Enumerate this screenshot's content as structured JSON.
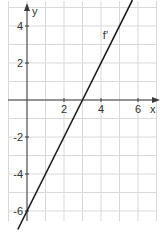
{
  "chart_data": {
    "type": "line",
    "title": "",
    "xlabel": "x",
    "ylabel": "y",
    "xlim": [
      -0.5,
      7.5
    ],
    "ylim": [
      -6.5,
      5.4
    ],
    "grid": true,
    "grid_step": 1,
    "x_ticks": [
      2,
      4,
      6
    ],
    "y_ticks": [
      4,
      2,
      -2,
      -4,
      -6
    ],
    "x_tick_labels": [
      "2",
      "4",
      "6"
    ],
    "y_tick_labels": [
      "4",
      "2",
      "-2",
      "-4",
      "-6"
    ],
    "series": [
      {
        "name": "f'",
        "equation": "f'(x) = 2x - 6",
        "x": [
          -0.5,
          0,
          3,
          5.7
        ],
        "y": [
          -7,
          -6,
          0,
          5.4
        ],
        "color": "#1a1a1a"
      }
    ],
    "annotations": [
      {
        "text": "f'",
        "x": 4.1,
        "y": 3.3
      }
    ],
    "colors": {
      "grid": "#d9d9d9",
      "axis": "#3a3a3a",
      "line": "#1a1a1a"
    }
  }
}
